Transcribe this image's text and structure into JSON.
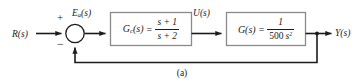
{
  "figure": {
    "caption": "(a)",
    "type": "control-system-block-diagram",
    "line_color": "#1c1c1c",
    "block_border_color": "#8a8a8a",
    "background": "#ffffff"
  },
  "signals": {
    "input": {
      "name": "R",
      "arg": "(s)",
      "label": "R(s)"
    },
    "error": {
      "name": "E",
      "subscript": "a",
      "arg": "(s)",
      "label": "Ea(s)"
    },
    "control": {
      "name": "U",
      "arg": "(s)",
      "label": "U(s)"
    },
    "output": {
      "name": "Y",
      "arg": "(s)",
      "label": "Y(s)"
    }
  },
  "summing_junction": {
    "name": "summing-junction",
    "plus_sign": "+",
    "minus_sign": "−",
    "plus_input": "R(s)",
    "minus_input": "Y(s)"
  },
  "blocks": [
    {
      "id": "controller",
      "name": "G",
      "subscript": "c",
      "arg": "(s)",
      "equals": "=",
      "numerator": "s + 1",
      "denominator": "s + 2",
      "label": "Gc(s) = (s+1)/(s+2)"
    },
    {
      "id": "plant",
      "name": "G",
      "subscript": "",
      "arg": "(s)",
      "equals": "=",
      "numerator": "1",
      "denominator_coefficient": "500",
      "denominator_variable": "s",
      "denominator_exponent": "2",
      "label": "G(s) = 1/(500 s^2)"
    }
  ],
  "feedback": {
    "name": "unity-feedback-path",
    "gain": "1",
    "sign": "−"
  }
}
